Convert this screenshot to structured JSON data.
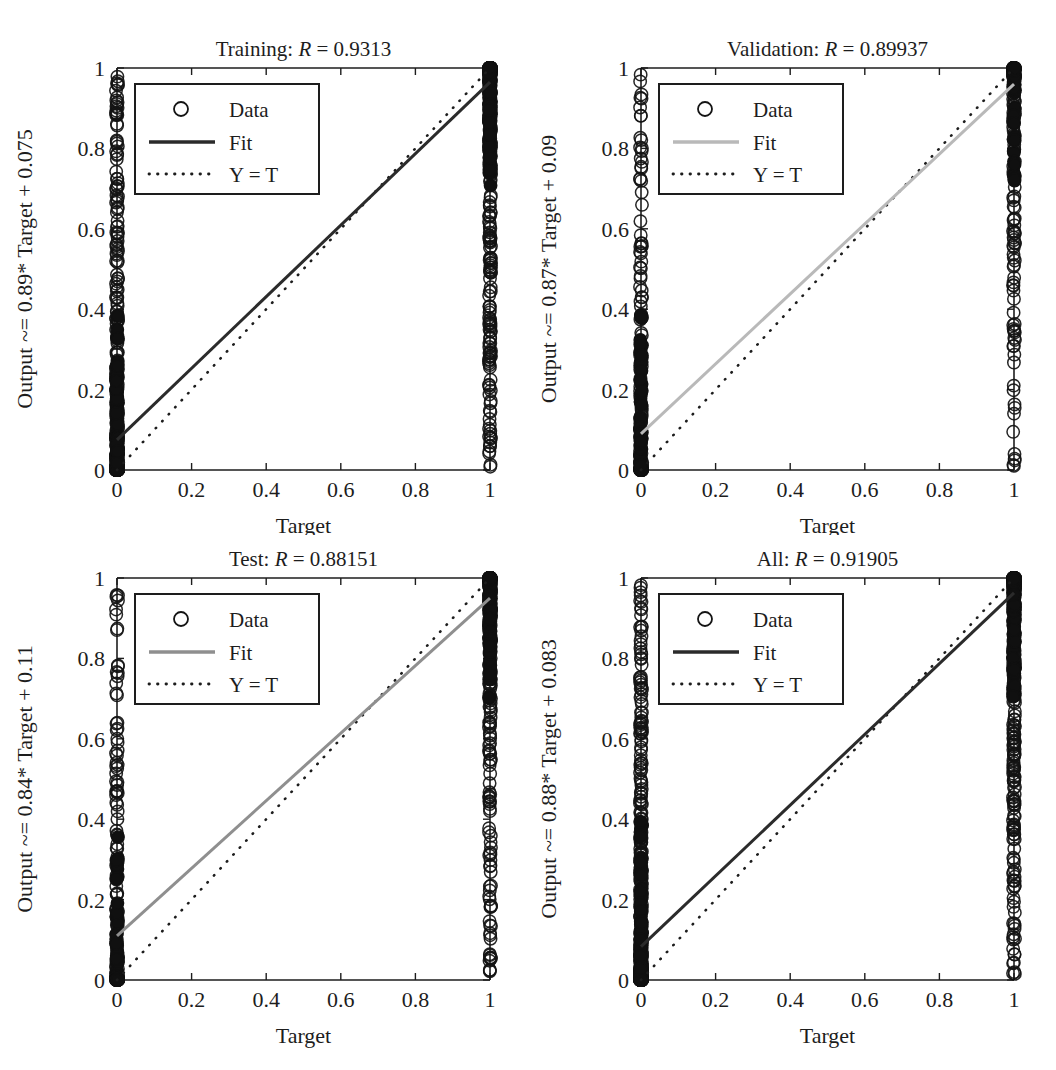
{
  "figure": {
    "type": "regression-plot-grid",
    "rows": 2,
    "columns": 2,
    "background": "#ffffff",
    "axis_color": "#1d1d1d"
  },
  "common": {
    "xlabel": "Target",
    "xticks": [
      "0",
      "0.2",
      "0.4",
      "0.6",
      "0.8",
      "1"
    ],
    "yticks": [
      "0",
      "0.2",
      "0.4",
      "0.6",
      "0.8",
      "1"
    ],
    "xlim": [
      0,
      1
    ],
    "ylim": [
      0,
      1
    ],
    "legend": {
      "data_label": "Data",
      "fit_label": "Fit",
      "identity_label": "Y = T",
      "marker_icon": "circle-marker-icon",
      "fit_icon": "solid-line-icon",
      "identity_icon": "dotted-line-icon"
    }
  },
  "chart_data": [
    {
      "id": "training",
      "type": "scatter",
      "title_prefix": "Training: ",
      "title_r_symbol": "R",
      "title_eq": " = ",
      "title_r_value": "0.9313",
      "title": "Training: R = 0.9313",
      "ylabel": "Output ~= 0.89* Target + 0.075",
      "xlabel": "Target",
      "slope": 0.89,
      "intercept": 0.075,
      "r": 0.9313,
      "xlim": [
        0,
        1
      ],
      "ylim": [
        0,
        1
      ],
      "xticks": [
        "0",
        "0.2",
        "0.4",
        "0.6",
        "0.8",
        "1"
      ],
      "yticks": [
        "0",
        "0.2",
        "0.4",
        "0.6",
        "0.8",
        "1"
      ],
      "grid": false,
      "legend_position": "top-left",
      "fit_line_shade": "#2b2b2b",
      "fit_line": {
        "x0": 0,
        "y0": 0.075,
        "x1": 1,
        "y1": 0.965
      },
      "identity_line": {
        "x0": 0,
        "y0": 0,
        "x1": 1,
        "y1": 1
      },
      "series": [
        {
          "name": "Data",
          "marker": "circle",
          "target0_density": "very-dense",
          "target1_density": "very-dense",
          "x": [
            0,
            1
          ],
          "note": "Binary targets: all points lie on x=0 or x=1; y spread is the network output"
        }
      ]
    },
    {
      "id": "validation",
      "type": "scatter",
      "title_prefix": "Validation: ",
      "title_r_symbol": "R",
      "title_eq": " = ",
      "title_r_value": "0.89937",
      "title": "Validation: R = 0.89937",
      "ylabel": "Output ~= 0.87* Target + 0.09",
      "xlabel": "Target",
      "slope": 0.87,
      "intercept": 0.09,
      "r": 0.89937,
      "xlim": [
        0,
        1
      ],
      "ylim": [
        0,
        1
      ],
      "xticks": [
        "0",
        "0.2",
        "0.4",
        "0.6",
        "0.8",
        "1"
      ],
      "yticks": [
        "0",
        "0.2",
        "0.4",
        "0.6",
        "0.8",
        "1"
      ],
      "grid": false,
      "legend_position": "top-left",
      "fit_line_shade": "#b9b9b9",
      "fit_line": {
        "x0": 0,
        "y0": 0.09,
        "x1": 1,
        "y1": 0.96
      },
      "identity_line": {
        "x0": 0,
        "y0": 0,
        "x1": 1,
        "y1": 1
      },
      "series": [
        {
          "name": "Data",
          "marker": "circle",
          "target0_density": "medium",
          "target1_density": "medium",
          "x": [
            0,
            1
          ],
          "note": "Binary targets: all points lie on x=0 or x=1; y spread is the network output"
        }
      ]
    },
    {
      "id": "test",
      "type": "scatter",
      "title_prefix": "Test: ",
      "title_r_symbol": "R",
      "title_eq": " = ",
      "title_r_value": "0.88151",
      "title": "Test: R = 0.88151",
      "ylabel": "Output ~= 0.84* Target + 0.11",
      "xlabel": "Target",
      "slope": 0.84,
      "intercept": 0.11,
      "r": 0.88151,
      "xlim": [
        0,
        1
      ],
      "ylim": [
        0,
        1
      ],
      "xticks": [
        "0",
        "0.2",
        "0.4",
        "0.6",
        "0.8",
        "1"
      ],
      "yticks": [
        "0",
        "0.2",
        "0.4",
        "0.6",
        "0.8",
        "1"
      ],
      "grid": false,
      "legend_position": "top-left",
      "fit_line_shade": "#8f8f8f",
      "fit_line": {
        "x0": 0,
        "y0": 0.11,
        "x1": 1,
        "y1": 0.95
      },
      "identity_line": {
        "x0": 0,
        "y0": 0,
        "x1": 1,
        "y1": 1
      },
      "series": [
        {
          "name": "Data",
          "marker": "circle",
          "target0_density": "medium",
          "target1_density": "dense",
          "x": [
            0,
            1
          ],
          "note": "Binary targets: all points lie on x=0 or x=1; y spread is the network output"
        }
      ]
    },
    {
      "id": "all",
      "type": "scatter",
      "title_prefix": "All: ",
      "title_r_symbol": "R",
      "title_eq": " = ",
      "title_r_value": "0.91905",
      "title": "All: R = 0.91905",
      "ylabel": "Output ~= 0.88* Target + 0.083",
      "xlabel": "Target",
      "slope": 0.88,
      "intercept": 0.083,
      "r": 0.91905,
      "xlim": [
        0,
        1
      ],
      "ylim": [
        0,
        1
      ],
      "xticks": [
        "0",
        "0.2",
        "0.4",
        "0.6",
        "0.8",
        "1"
      ],
      "yticks": [
        "0",
        "0.2",
        "0.4",
        "0.6",
        "0.8",
        "1"
      ],
      "grid": false,
      "legend_position": "top-left",
      "fit_line_shade": "#2b2b2b",
      "fit_line": {
        "x0": 0,
        "y0": 0.083,
        "x1": 1,
        "y1": 0.963
      },
      "identity_line": {
        "x0": 0,
        "y0": 0,
        "x1": 1,
        "y1": 1
      },
      "series": [
        {
          "name": "Data",
          "marker": "circle",
          "target0_density": "very-dense",
          "target1_density": "very-dense",
          "x": [
            0,
            1
          ],
          "note": "Binary targets: all points lie on x=0 or x=1; y spread is the network output"
        }
      ]
    }
  ]
}
